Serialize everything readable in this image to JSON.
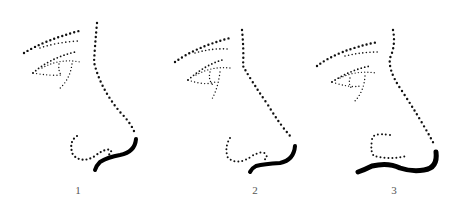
{
  "figures": [
    {
      "label": "1",
      "description": "nose profile with rounded tip"
    },
    {
      "label": "2",
      "description": "nose profile with medium tip"
    },
    {
      "label": "3",
      "description": "nose profile with pronounced tip"
    }
  ],
  "colors": {
    "ink": "#111111",
    "background": "#ffffff"
  }
}
